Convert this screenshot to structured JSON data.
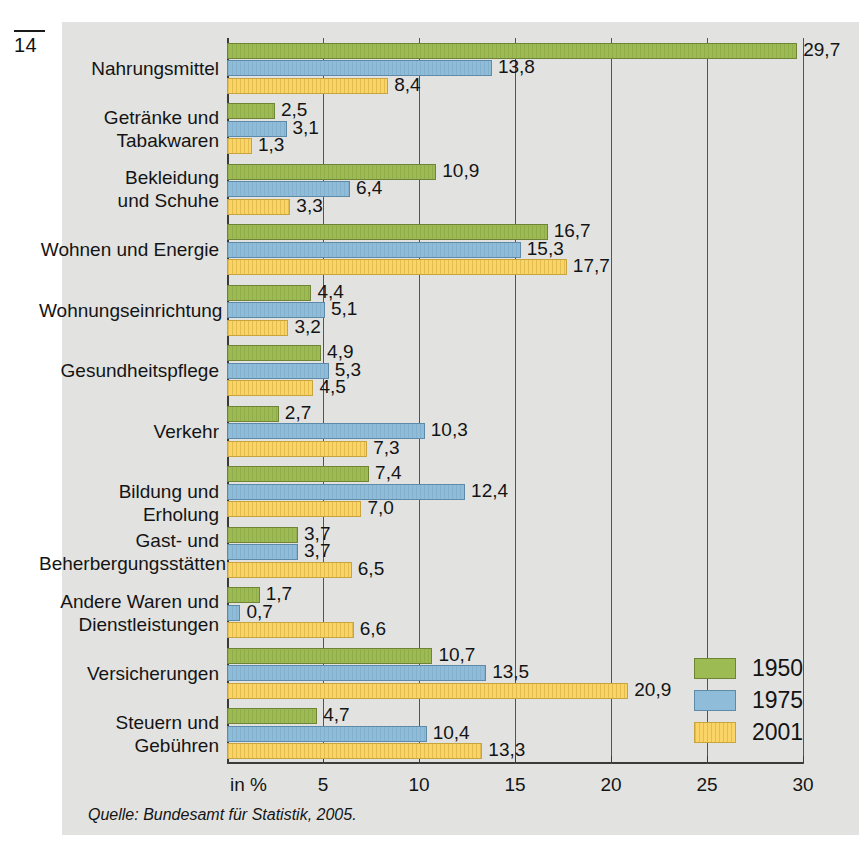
{
  "folio": {
    "page_number": "14"
  },
  "source": {
    "text": "Quelle: Bundesamt für Statistik, 2005."
  },
  "axis": {
    "unit_label": "in %",
    "tick_labels": [
      "5",
      "10",
      "15",
      "20",
      "25",
      "30"
    ]
  },
  "legend": {
    "items": [
      {
        "label": "1950",
        "color": "#9dbb53"
      },
      {
        "label": "1975",
        "color": "#8fbcd9"
      },
      {
        "label": "2001",
        "color": "#fbd468"
      }
    ]
  },
  "chart_data": {
    "type": "bar",
    "orientation": "horizontal",
    "title": "",
    "subtitle": "",
    "xlabel": "in %",
    "ylabel": "",
    "xlim": [
      0,
      30
    ],
    "xticks": [
      0,
      5,
      10,
      15,
      20,
      25,
      30
    ],
    "grid": true,
    "legend_position": "bottom-right",
    "decimal_separator": ",",
    "categories": [
      "Nahrungsmittel",
      "Getränke und\nTabakwaren",
      "Bekleidung\nund Schuhe",
      "Wohnen und Energie",
      "Wohnungseinrichtung",
      "Gesundheitspflege",
      "Verkehr",
      "Bildung und Erholung",
      "Gast- und\nBeherbergungsstätten",
      "Andere Waren und\nDienstleistungen",
      "Versicherungen",
      "Steuern und\nGebühren"
    ],
    "series": [
      {
        "name": "1950",
        "color": "#9dbb53",
        "values": [
          29.7,
          2.5,
          10.9,
          16.7,
          4.4,
          4.9,
          2.7,
          7.4,
          3.7,
          1.7,
          10.7,
          4.7
        ],
        "labels": [
          "29,7",
          "2,5",
          "10,9",
          "16,7",
          "4,4",
          "4,9",
          "2,7",
          "7,4",
          "3,7",
          "1,7",
          "10,7",
          "4,7"
        ]
      },
      {
        "name": "1975",
        "color": "#8fbcd9",
        "values": [
          13.8,
          3.1,
          6.4,
          15.3,
          5.1,
          5.3,
          10.3,
          12.4,
          3.7,
          0.7,
          13.5,
          10.4
        ],
        "labels": [
          "13,8",
          "3,1",
          "6,4",
          "15,3",
          "5,1",
          "5,3",
          "10,3",
          "12,4",
          "3,7",
          "0,7",
          "13,5",
          "10,4"
        ]
      },
      {
        "name": "2001",
        "color": "#fbd468",
        "values": [
          8.4,
          1.3,
          3.3,
          17.7,
          3.2,
          4.5,
          7.3,
          7.0,
          6.5,
          6.6,
          20.9,
          13.3
        ],
        "labels": [
          "8,4",
          "1,3",
          "3,3",
          "17,7",
          "3,2",
          "4,5",
          "7,3",
          "7,0",
          "6,5",
          "6,6",
          "20,9",
          "13,3"
        ]
      }
    ]
  }
}
